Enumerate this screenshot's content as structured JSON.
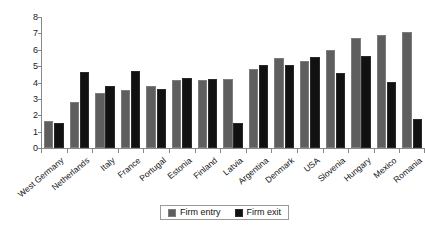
{
  "chart_data": {
    "type": "bar",
    "title": "",
    "subtitle": "",
    "xlabel": "",
    "ylabel": "",
    "ylim": [
      0,
      8
    ],
    "yticks": [
      0,
      1,
      2,
      3,
      4,
      5,
      6,
      7,
      8
    ],
    "grid": false,
    "legend_position": "bottom-center",
    "categories": [
      "West Germany",
      "Netherlands",
      "Italy",
      "France",
      "Portugal",
      "Estonia",
      "Finland",
      "Latvia",
      "Argentina",
      "Denmark",
      "USA",
      "Slovenia",
      "Hungary",
      "Mexico",
      "Romania"
    ],
    "series": [
      {
        "name": "Firm entry",
        "color": "#5e5e5e",
        "values": [
          1.65,
          2.8,
          3.35,
          3.55,
          3.8,
          4.15,
          4.15,
          4.2,
          4.8,
          5.5,
          5.3,
          6.0,
          6.7,
          6.9,
          7.1
        ]
      },
      {
        "name": "Firm exit",
        "color": "#111111",
        "values": [
          1.5,
          4.65,
          3.8,
          4.7,
          3.6,
          4.3,
          4.2,
          1.55,
          5.05,
          5.05,
          5.55,
          4.6,
          5.6,
          4.05,
          1.8
        ]
      }
    ]
  },
  "axis": {
    "y_tick_labels": [
      "0",
      "1",
      "2",
      "3",
      "4",
      "5",
      "6",
      "7",
      "8"
    ]
  },
  "legend": {
    "items": [
      {
        "label": "Firm entry",
        "swatch": "entry-swatch"
      },
      {
        "label": "Firm exit",
        "swatch": "exit-swatch"
      }
    ]
  }
}
